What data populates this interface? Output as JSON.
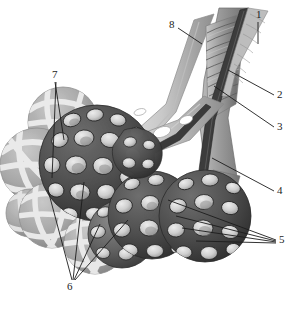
{
  "figure": {
    "style": "grayscale medical illustration",
    "background_color": "#ffffff",
    "line_color": "#1c1c1c",
    "labels": [
      {
        "id": "1",
        "text": "1",
        "x": 259,
        "y": 14,
        "leader": "vertical-short-down"
      },
      {
        "id": "2",
        "text": "2",
        "x": 279,
        "y": 94,
        "leader": "diagonal-up-left"
      },
      {
        "id": "3",
        "text": "3",
        "x": 279,
        "y": 125,
        "leader": "diagonal-up-left"
      },
      {
        "id": "4",
        "text": "4",
        "x": 279,
        "y": 189,
        "leader": "diagonal-up-left"
      },
      {
        "id": "5",
        "text": "5",
        "x": 280,
        "y": 237,
        "leader": "fan-left-four"
      },
      {
        "id": "6",
        "text": "6",
        "x": 68,
        "y": 283,
        "leader": "fan-up-four"
      },
      {
        "id": "7",
        "text": "7",
        "x": 53,
        "y": 72,
        "leader": "fan-down-two"
      },
      {
        "id": "8",
        "text": "8",
        "x": 170,
        "y": 23,
        "leader": "diagonal-down-right"
      }
    ],
    "structures": [
      {
        "name": "bronchiole-trunk",
        "fill": "#9a9a9a"
      },
      {
        "name": "cartilage-ring-band",
        "fill": "#8f8f8f"
      },
      {
        "name": "dark-vessel-stripe",
        "fill": "#3a3a3a"
      },
      {
        "name": "light-vessel-tube",
        "fill": "#c4c4c4"
      },
      {
        "name": "alveolar-sac-mesh",
        "fill": "#4a4a4a"
      },
      {
        "name": "alveolar-cell-lumen",
        "fill": "#d2d2d2"
      },
      {
        "name": "capillary-sphere",
        "fill": "#a9a9a9"
      },
      {
        "name": "capillary-net-band",
        "fill": "#e8e8e8"
      }
    ],
    "colors": {
      "ink": "#1c1c1c",
      "mesh_dark": "#4a4a4a",
      "mesh_darkest": "#2e2e2e",
      "cell_light": "#d6d6d6",
      "cell_mid": "#b0b0b0",
      "sphere_gray": "#a9a9a9",
      "sphere_band": "#ededed",
      "tube_light": "#c9c9c9",
      "tube_mid": "#9b9b9b",
      "tube_dark": "#3c3c3c"
    }
  }
}
